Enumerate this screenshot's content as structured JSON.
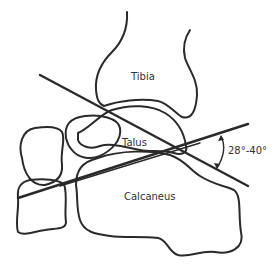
{
  "diagram": {
    "labels": {
      "tibia": "Tibia",
      "talus": "Talus",
      "calcaneus": "Calcaneus",
      "angle": "28°-40°"
    },
    "colors": {
      "line": "#2a2a2a",
      "background": "#ffffff"
    }
  }
}
